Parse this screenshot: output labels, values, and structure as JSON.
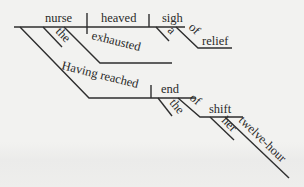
{
  "diagram": {
    "type": "Reed-Kellogg sentence diagram",
    "sentence_words": {
      "subject": "nurse",
      "verb": "heaved",
      "direct_object": "sigh",
      "subject_article": "the",
      "subject_adjective": "exhausted",
      "participle_phrase": "Having reached",
      "participle_object": "end",
      "object_article": "a",
      "object_preposition": "of",
      "object_prep_object": "relief",
      "end_article": "the",
      "end_preposition": "of",
      "end_prep_object": "shift",
      "shift_possessive": "her",
      "shift_adjective": "twelve-hour"
    },
    "colors": {
      "line": "#2e2e2e",
      "text": "#2a2a2a",
      "background": "#f2f2f0"
    }
  }
}
